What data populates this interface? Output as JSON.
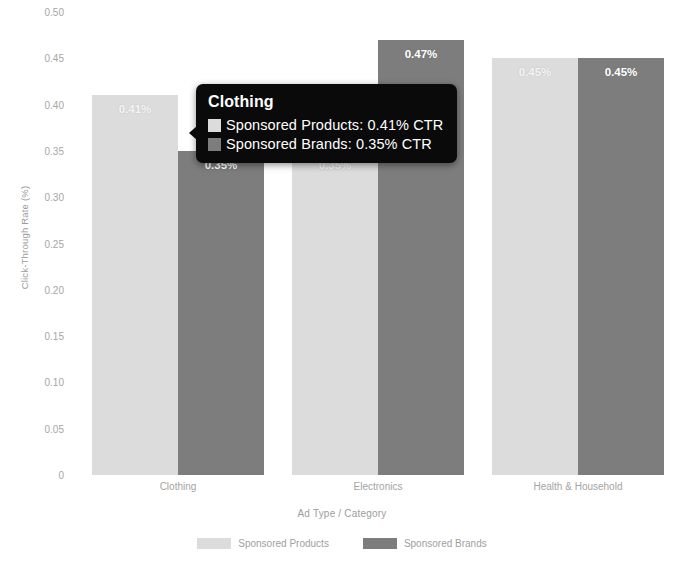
{
  "chart_data": {
    "type": "bar",
    "title": "",
    "xlabel": "Ad Type / Category",
    "ylabel": "Click-Through Rate (%)",
    "categories": [
      "Clothing",
      "Electronics",
      "Health & Household"
    ],
    "series": [
      {
        "name": "Sponsored Products",
        "color": "#dcdcdc",
        "values": [
          0.41,
          0.35,
          0.45
        ],
        "labels": [
          "0.41%",
          "0.35%",
          "0.45%"
        ]
      },
      {
        "name": "Sponsored Brands",
        "color": "#7d7d7d",
        "values": [
          0.35,
          0.47,
          0.45
        ],
        "labels": [
          "0.35%",
          "0.47%",
          "0.45%"
        ]
      }
    ],
    "ylim": [
      0,
      0.5
    ],
    "ytick_values": [
      0,
      0.05,
      0.1,
      0.15,
      0.2,
      0.25,
      0.3,
      0.35,
      0.4,
      0.45,
      0.5
    ],
    "ytick_labels": [
      "0",
      "0.05",
      "0.10",
      "0.15",
      "0.20",
      "0.25",
      "0.30",
      "0.35",
      "0.40",
      "0.45",
      "0.50"
    ],
    "grid": false,
    "legend_position": "bottom"
  },
  "tooltip": {
    "title": "Clothing",
    "rows": [
      {
        "swatch_color": "#dcdcdc",
        "text": "Sponsored Products: 0.41% CTR"
      },
      {
        "swatch_color": "#7d7d7d",
        "text": "Sponsored Brands: 0.35% CTR"
      }
    ]
  }
}
